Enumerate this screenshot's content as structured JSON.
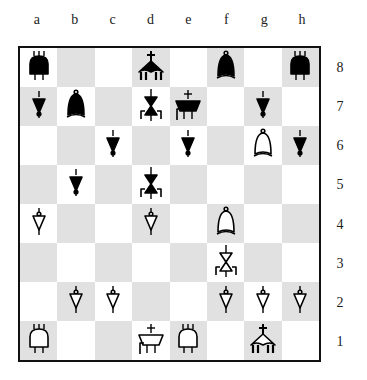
{
  "board": {
    "files": [
      "a",
      "b",
      "c",
      "d",
      "e",
      "f",
      "g",
      "h"
    ],
    "ranks": [
      "8",
      "7",
      "6",
      "5",
      "4",
      "3",
      "2",
      "1"
    ],
    "colors": {
      "light": "#ffffff",
      "dark": "#e1e1e1",
      "border": "#111111",
      "black_piece": "#000000",
      "white_piece": "#ffffff"
    },
    "pieces": [
      {
        "square": "a8",
        "color": "black",
        "type": "rook"
      },
      {
        "square": "d8",
        "color": "black",
        "type": "king"
      },
      {
        "square": "f8",
        "color": "black",
        "type": "bishop"
      },
      {
        "square": "h8",
        "color": "black",
        "type": "rook"
      },
      {
        "square": "a7",
        "color": "black",
        "type": "pawn"
      },
      {
        "square": "b7",
        "color": "black",
        "type": "bishop"
      },
      {
        "square": "d7",
        "color": "black",
        "type": "knight"
      },
      {
        "square": "e7",
        "color": "black",
        "type": "queen"
      },
      {
        "square": "g7",
        "color": "black",
        "type": "pawn"
      },
      {
        "square": "c6",
        "color": "black",
        "type": "pawn"
      },
      {
        "square": "e6",
        "color": "black",
        "type": "pawn"
      },
      {
        "square": "g6",
        "color": "white",
        "type": "bishop"
      },
      {
        "square": "h6",
        "color": "black",
        "type": "pawn"
      },
      {
        "square": "b5",
        "color": "black",
        "type": "pawn"
      },
      {
        "square": "d5",
        "color": "black",
        "type": "knight"
      },
      {
        "square": "a4",
        "color": "white",
        "type": "pawn"
      },
      {
        "square": "d4",
        "color": "white",
        "type": "pawn"
      },
      {
        "square": "f4",
        "color": "white",
        "type": "bishop"
      },
      {
        "square": "f3",
        "color": "white",
        "type": "knight"
      },
      {
        "square": "b2",
        "color": "white",
        "type": "pawn"
      },
      {
        "square": "c2",
        "color": "white",
        "type": "pawn"
      },
      {
        "square": "f2",
        "color": "white",
        "type": "pawn"
      },
      {
        "square": "g2",
        "color": "white",
        "type": "pawn"
      },
      {
        "square": "h2",
        "color": "white",
        "type": "pawn"
      },
      {
        "square": "a1",
        "color": "white",
        "type": "rook"
      },
      {
        "square": "d1",
        "color": "white",
        "type": "queen"
      },
      {
        "square": "e1",
        "color": "white",
        "type": "rook"
      },
      {
        "square": "g1",
        "color": "white",
        "type": "king"
      }
    ]
  }
}
